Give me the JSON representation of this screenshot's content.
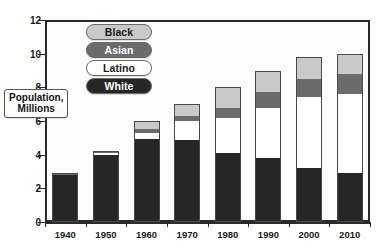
{
  "chart_data": {
    "type": "bar",
    "stacked": true,
    "title": "",
    "xlabel": "",
    "ylabel": "Population, Millions",
    "ylim": [
      0,
      12
    ],
    "ytick_labels": [
      "0",
      "2",
      "4",
      "6",
      "8",
      "10",
      "12"
    ],
    "ytick_values": [
      0,
      2,
      4,
      6,
      8,
      10,
      12
    ],
    "grid": false,
    "legend_position": "inside-top-left",
    "categories": [
      "1940",
      "1950",
      "1960",
      "1970",
      "1980",
      "1990",
      "2000",
      "2010"
    ],
    "series": [
      {
        "name": "White",
        "color": "#262626",
        "values": [
          2.8,
          4.0,
          4.9,
          4.9,
          4.1,
          3.8,
          3.2,
          2.9
        ]
      },
      {
        "name": "Latino",
        "color": "#ffffff",
        "values": [
          0.0,
          0.1,
          0.4,
          1.1,
          2.1,
          3.0,
          4.2,
          4.7
        ]
      },
      {
        "name": "Asian",
        "color": "#6b6b6b",
        "values": [
          0.05,
          0.05,
          0.2,
          0.3,
          0.6,
          0.9,
          1.1,
          1.2
        ]
      },
      {
        "name": "Black",
        "color": "#c9c9c9",
        "values": [
          0.05,
          0.05,
          0.5,
          0.7,
          1.2,
          1.3,
          1.3,
          1.2
        ]
      }
    ],
    "totals": [
      2.9,
      4.2,
      6.0,
      7.0,
      8.0,
      9.0,
      9.8,
      10.0
    ]
  },
  "legend": {
    "items": [
      {
        "label": "Black",
        "swatch_color": "#c9c9c9",
        "text_color": "#1a1a1a"
      },
      {
        "label": "Asian",
        "swatch_color": "#6b6b6b",
        "text_color": "#ffffff"
      },
      {
        "label": "Latino",
        "swatch_color": "#ffffff",
        "text_color": "#1a1a1a"
      },
      {
        "label": "White",
        "swatch_color": "#262626",
        "text_color": "#ffffff"
      }
    ]
  },
  "axis_title": {
    "line1": "Population,",
    "line2": "Millions"
  },
  "colors": {
    "axis": "#2b2b2b",
    "plot_background": "#fdfdfc",
    "page_background": "#ffffff"
  }
}
